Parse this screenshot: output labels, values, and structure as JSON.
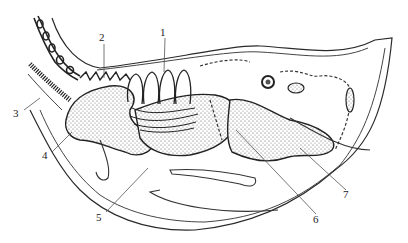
{
  "figure": {
    "type": "anatomical line drawing (sagittal section)",
    "style": {
      "ink": "#2a2a2a",
      "stipple": "#555555",
      "background": "#ffffff",
      "leader": "#555555"
    },
    "labels": [
      {
        "id": "1",
        "text": "1",
        "x": 163,
        "y": 32,
        "target": [
          163,
          70
        ]
      },
      {
        "id": "2",
        "text": "2",
        "x": 102,
        "y": 37,
        "target": [
          104,
          78
        ]
      },
      {
        "id": "3",
        "text": "3",
        "x": 16,
        "y": 113,
        "target": [
          40,
          98
        ]
      },
      {
        "id": "4",
        "text": "4",
        "x": 45,
        "y": 155,
        "target": [
          72,
          132
        ]
      },
      {
        "id": "5",
        "text": "5",
        "x": 99,
        "y": 217,
        "target": [
          148,
          168
        ]
      },
      {
        "id": "6",
        "text": "6",
        "x": 316,
        "y": 219,
        "target": [
          236,
          130
        ]
      },
      {
        "id": "7",
        "text": "7",
        "x": 346,
        "y": 194,
        "target": [
          300,
          148
        ]
      }
    ]
  }
}
